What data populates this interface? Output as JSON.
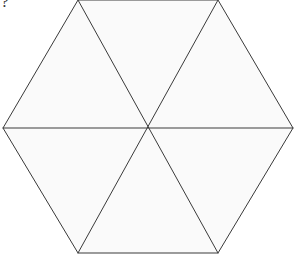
{
  "canvas": {
    "width": 296,
    "height": 260,
    "background_color": "#ffffff"
  },
  "annotation": {
    "question_mark": "?"
  },
  "figure": {
    "name": "regular-hexagon-divided-into-six-triangles",
    "shape": "hexagon",
    "fill_color": "#fafafa",
    "stroke_color": "#3a3a3a",
    "stroke_width": 1,
    "triangle_count": 6,
    "center": {
      "x": 148,
      "y": 128
    },
    "vertices": [
      {
        "name": "top-left",
        "x": 78,
        "y": 0
      },
      {
        "name": "top-right",
        "x": 218,
        "y": 0
      },
      {
        "name": "right",
        "x": 293,
        "y": 128
      },
      {
        "name": "bottom-right",
        "x": 218,
        "y": 253
      },
      {
        "name": "bottom-left",
        "x": 78,
        "y": 253
      },
      {
        "name": "left",
        "x": 3,
        "y": 128
      }
    ],
    "outline_path": "M 78 0 L 218 0 L 293 128 L 218 253 L 78 253 L 3 128 Z",
    "diagonals": [
      {
        "name": "diagonal-horizontal",
        "x1": 3,
        "y1": 128,
        "x2": 293,
        "y2": 128
      },
      {
        "name": "diagonal-top-left-to-bottom-right",
        "x1": 78,
        "y1": 0,
        "x2": 218,
        "y2": 253
      },
      {
        "name": "diagonal-top-right-to-bottom-left",
        "x1": 218,
        "y1": 0,
        "x2": 78,
        "y2": 253
      }
    ],
    "triangles": [
      {
        "name": "triangle-top-left",
        "path": "M 78 0 L 148 128 L 3 128 Z"
      },
      {
        "name": "triangle-top-center",
        "path": "M 78 0 L 218 0 L 148 128 Z"
      },
      {
        "name": "triangle-top-right",
        "path": "M 218 0 L 293 128 L 148 128 Z"
      },
      {
        "name": "triangle-bottom-right",
        "path": "M 148 128 L 293 128 L 218 253 Z"
      },
      {
        "name": "triangle-bottom-center",
        "path": "M 148 128 L 218 253 L 78 253 Z"
      },
      {
        "name": "triangle-bottom-left",
        "path": "M 3 128 L 148 128 L 78 253 Z"
      }
    ]
  }
}
